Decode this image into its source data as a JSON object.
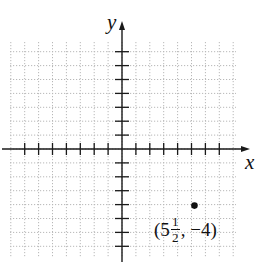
{
  "chart_data": {
    "type": "scatter",
    "title": "",
    "xlabel": "x",
    "ylabel": "y",
    "xlim": [
      -8,
      8
    ],
    "ylim": [
      -7,
      7
    ],
    "grid": true,
    "grid_style": "dotted",
    "points": [
      {
        "x": 5.5,
        "y": -4,
        "label": "(5 1/2, -4)"
      }
    ],
    "tick_spacing": 1,
    "tick_labels": false
  },
  "labels": {
    "x_axis": "x",
    "y_axis": "y",
    "point_open": "(5",
    "point_frac_num": "1",
    "point_frac_den": "2",
    "point_close": ", −4)"
  },
  "colors": {
    "axis": "#1a1a1a",
    "grid": "#b8b8b8",
    "point": "#111111"
  }
}
